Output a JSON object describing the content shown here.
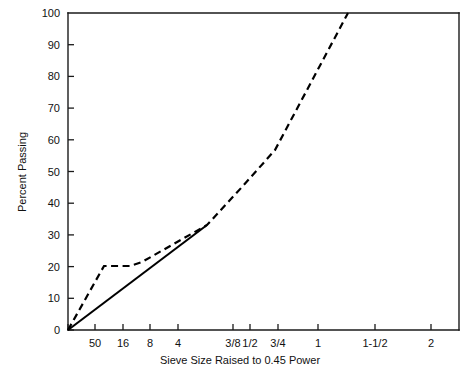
{
  "chart_data": {
    "type": "line",
    "title": "",
    "xlabel": "Sieve Size Raised to 0.45 Power",
    "ylabel": "Percent Passing",
    "ylim": [
      0,
      100
    ],
    "ytick_labels": [
      "0",
      "10",
      "20",
      "30",
      "40",
      "50",
      "60",
      "70",
      "80",
      "90",
      "100"
    ],
    "ytick_values": [
      0,
      10,
      20,
      30,
      40,
      50,
      60,
      70,
      80,
      90,
      100
    ],
    "xtick_labels": [
      "",
      "50",
      "16",
      "8",
      "4",
      "3/8",
      "1/2",
      "3/4",
      "1",
      "1-1/2",
      "2"
    ],
    "xtick_px": [
      68,
      95,
      123,
      150,
      178,
      233,
      250,
      278,
      318,
      375,
      431
    ],
    "grid": false,
    "legend_position": "none",
    "series": [
      {
        "name": "Maximum Density Line",
        "style": "solid",
        "points_px": [
          [
            68,
            330
          ],
          [
            207,
            225
          ]
        ],
        "points": [
          {
            "x_label": "",
            "y": 0
          },
          {
            "x_label": "4",
            "y": 33
          }
        ]
      },
      {
        "name": "Gradation Curve",
        "style": "dashed",
        "points_px": [
          [
            68,
            330
          ],
          [
            104,
            266
          ],
          [
            130,
            266
          ],
          [
            142,
            262
          ],
          [
            207,
            225
          ],
          [
            242,
            187
          ],
          [
            275,
            150
          ],
          [
            348,
            13
          ]
        ],
        "points": [
          {
            "x_label": "",
            "y": 0
          },
          {
            "x_label": "30",
            "y": 20
          },
          {
            "x_label": "16",
            "y": 20
          },
          {
            "x_label": "14",
            "y": 21
          },
          {
            "x_label": "4",
            "y": 33
          },
          {
            "x_label": "3/8",
            "y": 45
          },
          {
            "x_label": "1/2",
            "y": 57
          },
          {
            "x_label": "1",
            "y": 100
          }
        ]
      }
    ]
  },
  "plot_geometry": {
    "left_px": 68,
    "right_px": 459,
    "top_px": 13,
    "bottom_px": 330
  }
}
